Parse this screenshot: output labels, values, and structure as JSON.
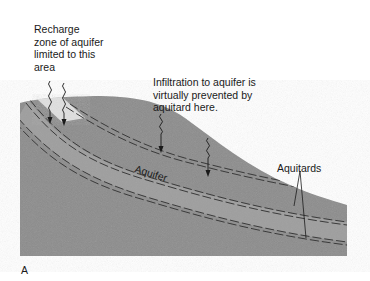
{
  "diagram": {
    "panel_label": "A",
    "labels": {
      "recharge_zone": "Recharge zone of aquifer limited to this area",
      "infiltration": "Infiltration to aquifer is virtually prevented by aquitard here.",
      "aquifer": "Aquifer",
      "aquitards": "Aquitards"
    },
    "colors": {
      "ground": "#8f8f8f",
      "aquifer_band": "#a3a3a3",
      "recharge_zone": "#e2e2e2",
      "aquitard_lines": "#3a3a3a",
      "text": "#1a1a1a"
    }
  }
}
